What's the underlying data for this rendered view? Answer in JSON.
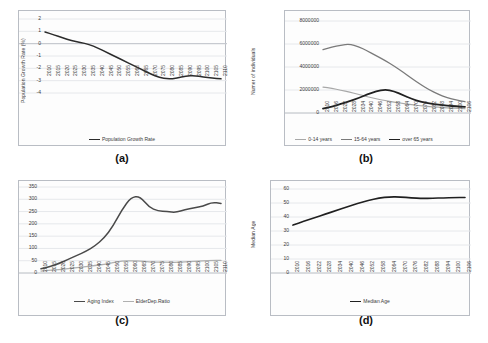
{
  "figure": {
    "panels": [
      "(a)",
      "(b)",
      "(c)",
      "(d)"
    ]
  },
  "chart_data": [
    {
      "id": "a",
      "panel_label": "(a)",
      "type": "line",
      "title": "",
      "xlabel": "",
      "ylabel": "Population Growth Rate (%)",
      "ylim": [
        -4,
        2
      ],
      "yticks": [
        "2",
        "1",
        "0",
        "-1",
        "-2",
        "-3",
        "-4"
      ],
      "grid": true,
      "legend_position": "bottom",
      "categories": [
        "2010",
        "2015",
        "2020",
        "2025",
        "2030",
        "2035",
        "2040",
        "2045",
        "2050",
        "2055",
        "2060",
        "2065",
        "2070",
        "2075",
        "2080",
        "2085",
        "2090",
        "2095",
        "2100",
        "2105",
        "2110"
      ],
      "series": [
        {
          "name": "Population Growth Rate",
          "color": "#2b2b2b",
          "width": 1.5,
          "values": [
            0.95,
            0.72,
            0.48,
            0.24,
            0.1,
            -0.05,
            -0.35,
            -0.7,
            -1.05,
            -1.4,
            -1.75,
            -2.1,
            -2.45,
            -2.75,
            -2.87,
            -2.8,
            -2.62,
            -2.58,
            -2.7,
            -2.78,
            -2.85
          ]
        }
      ]
    },
    {
      "id": "b",
      "panel_label": "(b)",
      "type": "line",
      "title": "",
      "xlabel": "",
      "ylabel": "Numer of individuals",
      "ylim": [
        0,
        8000000
      ],
      "yticks": [
        "8000000",
        "6000000",
        "4000000",
        "2000000",
        "0"
      ],
      "grid": true,
      "legend_position": "bottom",
      "categories": [
        "2010",
        "2016",
        "2022",
        "2028",
        "2034",
        "2040",
        "2046",
        "2052",
        "2058",
        "2064",
        "2070",
        "2076",
        "2082",
        "2088",
        "2094",
        "2100",
        "2106"
      ],
      "series": [
        {
          "name": "0-14 years",
          "color": "#a8a8a8",
          "width": 1.2,
          "values": [
            2250000,
            2150000,
            1980000,
            1820000,
            1620000,
            1420000,
            1230000,
            1080000,
            950000,
            830000,
            720000,
            630000,
            560000,
            500000,
            450000,
            410000,
            380000
          ]
        },
        {
          "name": "15-64 years",
          "color": "#7a7a7a",
          "width": 1.3,
          "values": [
            5520000,
            5720000,
            5900000,
            6000000,
            5780000,
            5400000,
            4980000,
            4560000,
            4080000,
            3560000,
            3000000,
            2480000,
            2000000,
            1620000,
            1320000,
            1120000,
            980000
          ]
        },
        {
          "name": "over 65 years",
          "color": "#202020",
          "width": 1.8,
          "values": [
            380000,
            560000,
            780000,
            1020000,
            1300000,
            1620000,
            1880000,
            2050000,
            1900000,
            1560000,
            1220000,
            980000,
            820000,
            720000,
            640000,
            580000,
            540000
          ]
        }
      ]
    },
    {
      "id": "c",
      "panel_label": "(c)",
      "type": "line",
      "title": "",
      "xlabel": "",
      "ylabel": "",
      "ylim": [
        0,
        350
      ],
      "yticks": [
        "350",
        "300",
        "250",
        "200",
        "150",
        "100",
        "50",
        "0"
      ],
      "grid": true,
      "legend_position": "bottom",
      "categories": [
        "2010",
        "2015",
        "2020",
        "2025",
        "2030",
        "2035",
        "2040",
        "2045",
        "2050",
        "2055",
        "2060",
        "2065",
        "2070",
        "2075",
        "2080",
        "2085",
        "2090",
        "2095",
        "2100",
        "2105",
        "2110"
      ],
      "series": [
        {
          "name": "Aging Index",
          "color": "#4a4a4a",
          "width": 1.5,
          "values": [
            17,
            26,
            39,
            55,
            72,
            88,
            110,
            142,
            190,
            258,
            308,
            312,
            268,
            252,
            250,
            246,
            258,
            265,
            272,
            288,
            283
          ]
        },
        {
          "name": "ElderDep.Ratio",
          "color": "#b0b0b0",
          "width": 1.3,
          "values": [
            8,
            11,
            14,
            18,
            22,
            26,
            30,
            35,
            42,
            48,
            50,
            49,
            45,
            44,
            44,
            43,
            45,
            47,
            49,
            51,
            51
          ]
        }
      ]
    },
    {
      "id": "d",
      "panel_label": "(d)",
      "type": "line",
      "title": "",
      "xlabel": "",
      "ylabel": "Median Age",
      "ylim": [
        0,
        60
      ],
      "yticks": [
        "60",
        "50",
        "40",
        "30",
        "20",
        "10",
        "0"
      ],
      "grid": true,
      "legend_position": "bottom",
      "categories": [
        "2010",
        "2016",
        "2022",
        "2028",
        "2034",
        "2040",
        "2046",
        "2052",
        "2058",
        "2064",
        "2070",
        "2076",
        "2082",
        "2088",
        "2094",
        "2100",
        "2106"
      ],
      "series": [
        {
          "name": "Median Age",
          "color": "#202020",
          "width": 1.6,
          "values": [
            34.2,
            37.0,
            39.5,
            42.0,
            44.6,
            47.2,
            49.6,
            51.8,
            53.6,
            54.4,
            54.3,
            53.7,
            53.2,
            53.4,
            53.7,
            53.9,
            53.9
          ]
        }
      ]
    }
  ]
}
